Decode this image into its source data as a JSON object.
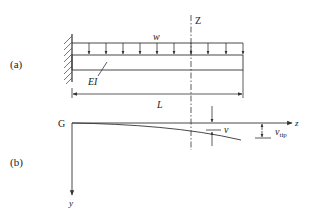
{
  "figure": {
    "panel_a": {
      "label": "(a)",
      "load_label": "w",
      "stiffness_label": "EI",
      "length_label": "L",
      "section_label": "Z",
      "load_arrow_count": 10
    },
    "panel_b": {
      "label": "(b)",
      "origin_label": "G",
      "horizontal_axis_label": "z",
      "vertical_axis_label": "y",
      "deflection_label": "v",
      "tip_deflection_label": "v",
      "tip_deflection_subscript": "tip"
    },
    "colors": {
      "line": "#333333",
      "background": "#ffffff"
    }
  }
}
